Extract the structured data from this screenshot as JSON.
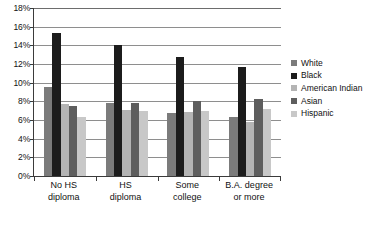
{
  "chart_data": {
    "type": "bar",
    "title": "",
    "subtitle": "",
    "xlabel": "",
    "ylabel": "",
    "ylim": [
      0,
      18
    ],
    "ytick_step": 2,
    "ytick_labels": [
      "0%",
      "2%",
      "4%",
      "6%",
      "8%",
      "10%",
      "12%",
      "14%",
      "16%",
      "18%"
    ],
    "grid": true,
    "grid_axis": "y",
    "legend_position": "right",
    "categories": [
      "No HS diploma",
      "HS diploma",
      "Some college",
      "B.A. degree or more"
    ],
    "category_lines": [
      [
        "No HS",
        "diploma"
      ],
      [
        "HS",
        "diploma"
      ],
      [
        "Some",
        "college"
      ],
      [
        "B.A. degree",
        "or more"
      ]
    ],
    "series": [
      {
        "name": "White",
        "color": "#7b7b7b",
        "values": [
          9.5,
          7.8,
          6.7,
          6.3
        ]
      },
      {
        "name": "Black",
        "color": "#1c1c1c",
        "values": [
          15.3,
          14.0,
          12.8,
          11.7
        ]
      },
      {
        "name": "American Indian",
        "color": "#b4b4b4",
        "values": [
          7.7,
          7.1,
          6.9,
          5.8
        ]
      },
      {
        "name": "Asian",
        "color": "#5e5e5e",
        "values": [
          7.5,
          7.8,
          8.0,
          8.2
        ]
      },
      {
        "name": "Hispanic",
        "color": "#c8c8c8",
        "values": [
          6.3,
          7.0,
          7.0,
          7.2
        ]
      }
    ]
  },
  "colors": {
    "axis": "#3b3b3b",
    "gridline": "#8e8e8e",
    "text": "#111111",
    "background": "#ffffff"
  },
  "caption": ""
}
